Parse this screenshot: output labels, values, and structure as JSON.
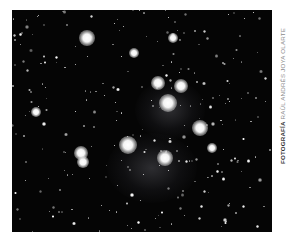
{
  "photo": {
    "subject": "star cluster with nebula",
    "background": "#050505",
    "nebulae": [
      {
        "x": 152,
        "y": 168,
        "w": 90,
        "h": 70
      },
      {
        "x": 170,
        "y": 110,
        "w": 70,
        "h": 60
      }
    ],
    "bright_stars": [
      {
        "x": 87,
        "y": 38,
        "r": 8
      },
      {
        "x": 158,
        "y": 83,
        "r": 7
      },
      {
        "x": 181,
        "y": 86,
        "r": 7
      },
      {
        "x": 168,
        "y": 103,
        "r": 9
      },
      {
        "x": 200,
        "y": 128,
        "r": 8
      },
      {
        "x": 165,
        "y": 158,
        "r": 8
      },
      {
        "x": 128,
        "y": 145,
        "r": 9
      },
      {
        "x": 81,
        "y": 153,
        "r": 7
      },
      {
        "x": 83,
        "y": 162,
        "r": 6
      },
      {
        "x": 173,
        "y": 38,
        "r": 5
      },
      {
        "x": 134,
        "y": 53,
        "r": 5
      },
      {
        "x": 36,
        "y": 112,
        "r": 5
      },
      {
        "x": 212,
        "y": 148,
        "r": 5
      }
    ],
    "faint_star_count": 260,
    "faint_star_seed": 7
  },
  "credit": {
    "label": "FOTOGRAFÍA",
    "name": " RAÚL ANDRÉS JOYA OLARTE"
  }
}
